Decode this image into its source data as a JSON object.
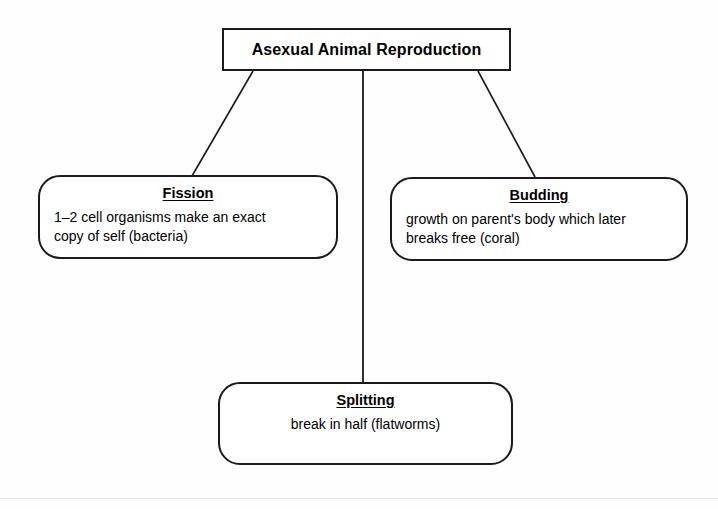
{
  "diagram": {
    "title": "Asexual Animal Reproduction",
    "root": {
      "label": "Asexual Animal Reproduction",
      "shape": "rectangle"
    },
    "children": [
      {
        "id": "fission",
        "heading": "Fission",
        "body": "1–2 cell organisms make an exact\ncopy of self (bacteria)",
        "shape": "rounded-rectangle",
        "position": "left"
      },
      {
        "id": "budding",
        "heading": "Budding",
        "body": "growth on parent's body which later\nbreaks free (coral)",
        "shape": "rounded-rectangle",
        "position": "right"
      },
      {
        "id": "splitting",
        "heading": "Splitting",
        "body": "break in half (flatworms)",
        "shape": "rounded-rectangle",
        "position": "bottom-center"
      }
    ],
    "connectors": [
      {
        "from": "root",
        "to": "fission",
        "style": "diagonal-line"
      },
      {
        "from": "root",
        "to": "splitting",
        "style": "vertical-line"
      },
      {
        "from": "root",
        "to": "budding",
        "style": "diagonal-line"
      }
    ],
    "colors": {
      "stroke": "#1a1a1a",
      "text": "#000000",
      "background": "#fefefe",
      "page_edge": "#e9e9ec"
    }
  }
}
